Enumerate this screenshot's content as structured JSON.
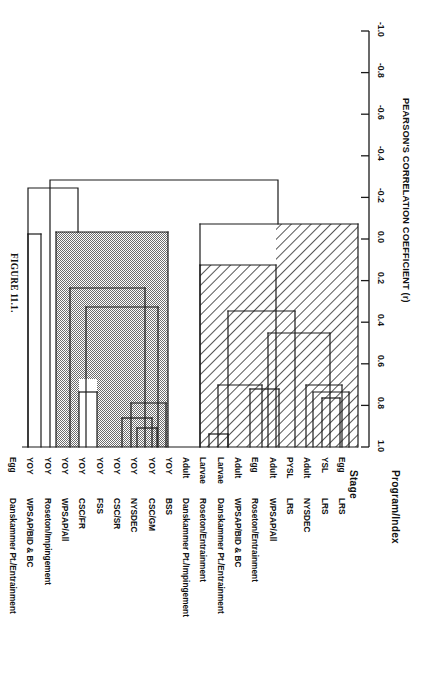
{
  "figure": {
    "caption": "FIGURE 11.1.",
    "orientation": "rotated-90"
  },
  "axis": {
    "title": "PEARSON'S CORRELATION COEFFICIENT (r)",
    "tick_labels": [
      "-1.0",
      "-0.8",
      "-0.6",
      "-0.4",
      "-0.2",
      "0.0",
      "0.2",
      "0.4",
      "0.6",
      "0.8",
      "1.0"
    ],
    "min": -1.0,
    "max": 1.0,
    "step": 0.2
  },
  "columns": {
    "stage_header": "Stage",
    "program_header": "Program/Index"
  },
  "leaves": [
    {
      "stage": "Egg",
      "program": "LRS"
    },
    {
      "stage": "YSL",
      "program": "LRS"
    },
    {
      "stage": "Adult",
      "program": "NYSDEC"
    },
    {
      "stage": "PYSL",
      "program": "LRS"
    },
    {
      "stage": "Adult",
      "program": "WPSAP/All"
    },
    {
      "stage": "Egg",
      "program": "Roseton/Entrainment"
    },
    {
      "stage": "Adult",
      "program": "WPSAP/BID & BC"
    },
    {
      "stage": "Larvae",
      "program": "Danskammer Pt./Entrainment"
    },
    {
      "stage": "Larvae",
      "program": "Roseton/Entrainment"
    },
    {
      "stage": "Adult",
      "program": "Danskammer Pt./Impingement"
    },
    {
      "stage": "YOY",
      "program": "BSS"
    },
    {
      "stage": "YOY",
      "program": "CSC/GM"
    },
    {
      "stage": "YOY",
      "program": "NYSDEC"
    },
    {
      "stage": "YOY",
      "program": "CSC/SR"
    },
    {
      "stage": "YOY",
      "program": "FSS"
    },
    {
      "stage": "YOY",
      "program": "CSC/FR"
    },
    {
      "stage": "YOY",
      "program": "WPSAP/All"
    },
    {
      "stage": "YOY",
      "program": "Roseton/Impingement"
    },
    {
      "stage": "YOY",
      "program": "WPSAP/BID & BC"
    },
    {
      "stage": "Egg",
      "program": "Danskammer Pt./Entrainment"
    }
  ],
  "chart_data": {
    "type": "dendrogram",
    "title": "FIGURE 11.1.",
    "xlabel": "",
    "ylabel": "PEARSON'S CORRELATION COEFFICIENT (r)",
    "ylim": [
      -1.0,
      1.0
    ],
    "grid": false,
    "legend": "none",
    "orientation": "horizontal-rotated",
    "leaf_order": [
      "Egg LRS",
      "YSL LRS",
      "Adult NYSDEC",
      "PYSL LRS",
      "Adult WPSAP/All",
      "Egg Roseton/Entrainment",
      "Adult WPSAP/BID & BC",
      "Larvae Danskammer Pt./Entrainment",
      "Larvae Roseton/Entrainment",
      "Adult Danskammer Pt./Impingement",
      "YOY BSS",
      "YOY CSC/GM",
      "YOY NYSDEC",
      "YOY CSC/SR",
      "YOY FSS",
      "YOY CSC/FR",
      "YOY WPSAP/All",
      "YOY Roseton/Impingement",
      "YOY WPSAP/BID & BC",
      "Egg Danskammer Pt./Entrainment"
    ],
    "merges": [
      {
        "id": "m1",
        "children": [
          "Egg LRS",
          "YSL LRS"
        ],
        "r": 0.74,
        "fill": "hatched"
      },
      {
        "id": "m2",
        "children": [
          "Adult NYSDEC",
          "m1"
        ],
        "r": 0.7,
        "fill": "hatched"
      },
      {
        "id": "m3",
        "children": [
          "PYSL LRS",
          "Adult WPSAP/All"
        ],
        "r": 0.73,
        "fill": "hatched"
      },
      {
        "id": "m4",
        "children": [
          "m2",
          "m3"
        ],
        "r": 0.53,
        "fill": "hatched"
      },
      {
        "id": "m5",
        "children": [
          "Egg Roseton/Entrainment",
          "Adult WPSAP/BID & BC"
        ],
        "r": 0.74,
        "fill": "hatched"
      },
      {
        "id": "m6",
        "children": [
          "Larvae Danskammer Pt./Entrainment",
          "Larvae Roseton/Entrainment"
        ],
        "r": 0.96,
        "fill": "hatched"
      },
      {
        "id": "m7",
        "children": [
          "m5",
          "m6"
        ],
        "r": 0.73,
        "fill": "hatched"
      },
      {
        "id": "m8",
        "children": [
          "m4",
          "m7"
        ],
        "r": 0.61,
        "fill": "hatched"
      },
      {
        "id": "m9",
        "children": [
          "m8",
          "Adult Danskammer Pt./Impingement"
        ],
        "r": 0.39,
        "fill": "hatched"
      },
      {
        "id": "m10",
        "children": [
          "m9",
          "root_hatched"
        ],
        "r": 0.26,
        "fill": "hatched"
      },
      {
        "id": "g1",
        "children": [
          "YOY WPSAP/All",
          "YOY CSC/FR"
        ],
        "r": 0.79,
        "fill": "grey"
      },
      {
        "id": "g2",
        "children": [
          "YOY CSC/SR",
          "YOY FSS"
        ],
        "r": 0.86,
        "fill": "grey"
      },
      {
        "id": "g3",
        "children": [
          "g2",
          "YOY NYSDEC"
        ],
        "r": 0.9,
        "fill": "grey"
      },
      {
        "id": "g4",
        "children": [
          "g3",
          "YOY CSC/GM"
        ],
        "r": 0.82,
        "fill": "grey"
      },
      {
        "id": "g5",
        "children": [
          "g1",
          "g4"
        ],
        "r": 0.57,
        "fill": "grey"
      },
      {
        "id": "g6",
        "children": [
          "g5",
          "YOY BSS"
        ],
        "r": 0.48,
        "fill": "grey"
      },
      {
        "id": "g7",
        "children": [
          "g6",
          "YOY Roseton/Impingement"
        ],
        "r": 0.21,
        "fill": "grey"
      },
      {
        "id": "w1",
        "children": [
          "YOY WPSAP/BID & BC",
          "Egg Danskammer Pt./Entrainment"
        ],
        "r": 0.23,
        "fill": "white"
      },
      {
        "id": "w2",
        "children": [
          "w1",
          "g7"
        ],
        "r": -0.24,
        "fill": "white"
      },
      {
        "id": "root",
        "children": [
          "w2",
          "m10"
        ],
        "r": -0.28,
        "fill": "white"
      }
    ]
  },
  "style": {
    "line_color": "#1a1a1a",
    "grey_fill": "#b3b3b3",
    "hatch_color": "#333333",
    "background": "#ffffff"
  }
}
